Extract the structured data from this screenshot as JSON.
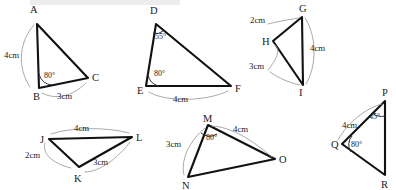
{
  "figure": {
    "background_color": "#ffffff",
    "line_color": "#111111",
    "leader_color": "#9a9a9a",
    "units": "cm"
  },
  "triangles": [
    {
      "id": "abc",
      "vertices": [
        {
          "label": "A",
          "x": 37,
          "y": 24
        },
        {
          "label": "B",
          "x": 39,
          "y": 88
        },
        {
          "label": "C",
          "x": 88,
          "y": 78
        }
      ],
      "vertex_label_pos": [
        {
          "x": 30,
          "y": 13
        },
        {
          "x": 33,
          "y": 100
        },
        {
          "x": 92,
          "y": 81
        }
      ],
      "sides": [
        {
          "label": "4cm",
          "x": 4,
          "y": 58
        },
        {
          "label": "3cm",
          "x": 57,
          "y": 99
        }
      ],
      "angles": [
        {
          "label": "80°",
          "x": 44,
          "y": 78
        }
      ]
    },
    {
      "id": "def",
      "vertices": [
        {
          "label": "D",
          "x": 156,
          "y": 24
        },
        {
          "label": "E",
          "x": 146,
          "y": 86
        },
        {
          "label": "F",
          "x": 231,
          "y": 86
        }
      ],
      "vertex_label_pos": [
        {
          "x": 150,
          "y": 14
        },
        {
          "x": 137,
          "y": 94
        },
        {
          "x": 235,
          "y": 92
        }
      ],
      "sides": [
        {
          "label": "4cm",
          "x": 173,
          "y": 102
        }
      ],
      "angles": [
        {
          "label": "55°",
          "x": 155,
          "y": 39
        },
        {
          "label": "80°",
          "x": 154,
          "y": 76
        }
      ]
    },
    {
      "id": "ghi",
      "vertices": [
        {
          "label": "G",
          "x": 302,
          "y": 17
        },
        {
          "label": "H",
          "x": 273,
          "y": 41
        },
        {
          "label": "I",
          "x": 303,
          "y": 85
        }
      ],
      "vertex_label_pos": [
        {
          "x": 299,
          "y": 12
        },
        {
          "x": 262,
          "y": 45
        },
        {
          "x": 299,
          "y": 96
        }
      ],
      "sides": [
        {
          "label": "2cm",
          "x": 250,
          "y": 23
        },
        {
          "label": "4cm",
          "x": 310,
          "y": 51
        },
        {
          "label": "3cm",
          "x": 249,
          "y": 69
        }
      ],
      "angles": []
    },
    {
      "id": "pqr",
      "vertices": [
        {
          "label": "P",
          "x": 385,
          "y": 101
        },
        {
          "label": "Q",
          "x": 342,
          "y": 144
        },
        {
          "label": "R",
          "x": 385,
          "y": 175
        }
      ],
      "vertex_label_pos": [
        {
          "x": 382,
          "y": 96
        },
        {
          "x": 331,
          "y": 148
        },
        {
          "x": 381,
          "y": 188
        }
      ],
      "sides": [
        {
          "label": "4cm",
          "x": 342,
          "y": 128
        }
      ],
      "angles": [
        {
          "label": "45°",
          "x": 371,
          "y": 118
        },
        {
          "label": "80°",
          "x": 351,
          "y": 146
        }
      ]
    },
    {
      "id": "jkl",
      "vertices": [
        {
          "label": "J",
          "x": 49,
          "y": 139
        },
        {
          "label": "K",
          "x": 79,
          "y": 167
        },
        {
          "label": "L",
          "x": 132,
          "y": 137
        }
      ],
      "vertex_label_pos": [
        {
          "x": 40,
          "y": 141
        },
        {
          "x": 74,
          "y": 182
        },
        {
          "x": 136,
          "y": 141
        }
      ],
      "sides": [
        {
          "label": "4cm",
          "x": 74,
          "y": 131
        },
        {
          "label": "2cm",
          "x": 38,
          "y": 158
        },
        {
          "label": "3cm",
          "x": 93,
          "y": 165
        }
      ],
      "angles": []
    },
    {
      "id": "mno",
      "vertices": [
        {
          "label": "M",
          "x": 208,
          "y": 125
        },
        {
          "label": "N",
          "x": 188,
          "y": 177
        },
        {
          "label": "O",
          "x": 275,
          "y": 159
        }
      ],
      "vertex_label_pos": [
        {
          "x": 203,
          "y": 122
        },
        {
          "x": 182,
          "y": 189
        },
        {
          "x": 279,
          "y": 163
        }
      ],
      "sides": [
        {
          "label": "3cm",
          "x": 168,
          "y": 145
        },
        {
          "label": "4cm",
          "x": 235,
          "y": 131
        }
      ],
      "angles": [
        {
          "label": "80°",
          "x": 207,
          "y": 137
        }
      ]
    }
  ]
}
